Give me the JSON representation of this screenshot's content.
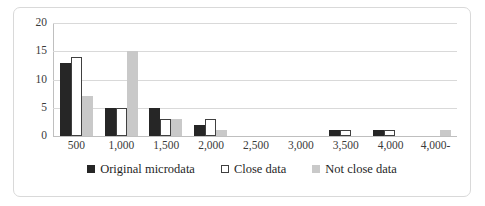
{
  "chart_data": {
    "type": "bar",
    "title": "",
    "subtitle": "",
    "xlabel": "",
    "ylabel": "",
    "ylim": [
      0,
      20
    ],
    "yticks": [
      0,
      5,
      10,
      15,
      20
    ],
    "grid": true,
    "legend_position": "bottom",
    "categories": [
      "500",
      "1,000",
      "1,500",
      "2,000",
      "2,500",
      "3,000",
      "3,500",
      "4,000",
      "4,000-"
    ],
    "series": [
      {
        "name": "Original microdata",
        "color": "#262626",
        "values": [
          13,
          5,
          5,
          2,
          0,
          0,
          1,
          1,
          0
        ]
      },
      {
        "name": "Close data",
        "color": "#ffffff",
        "values": [
          14,
          5,
          3,
          3,
          0,
          0,
          1,
          1,
          0
        ]
      },
      {
        "name": "Not close data",
        "color": "#c9c9c9",
        "values": [
          7,
          15,
          3,
          1,
          0,
          0,
          0,
          0,
          1
        ]
      }
    ]
  }
}
